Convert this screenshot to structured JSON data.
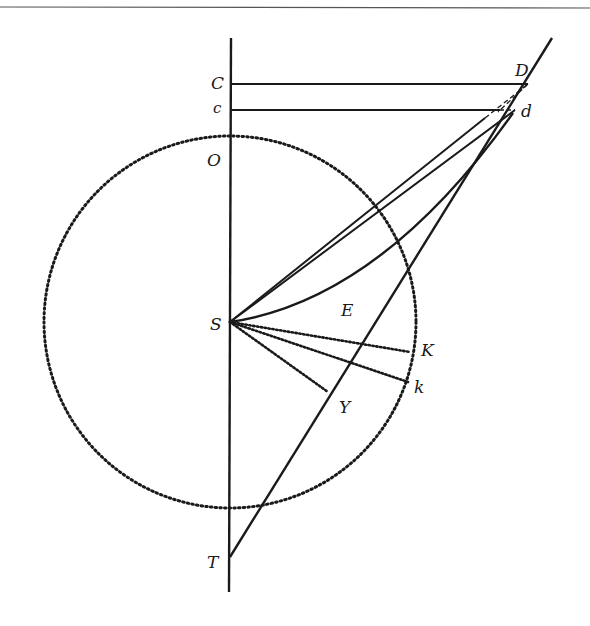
{
  "diagram": {
    "type": "geometric-figure",
    "colors": {
      "ink": "#1a1a1a",
      "background": "#ffffff"
    },
    "labels": {
      "C": "C",
      "c": "c",
      "D": "D",
      "d": "d",
      "O": "O",
      "S": "S",
      "E": "E",
      "K": "K",
      "k": "k",
      "Y": "Y",
      "T": "T"
    },
    "points": {
      "C": [
        230,
        84
      ],
      "c": [
        230,
        110
      ],
      "D": [
        528,
        84
      ],
      "d": [
        515,
        110
      ],
      "O": [
        230,
        136
      ],
      "S": [
        230,
        322
      ],
      "K": [
        410,
        352
      ],
      "k": [
        408,
        382
      ],
      "Y": [
        328,
        392
      ],
      "T": [
        230,
        557
      ]
    },
    "circle": {
      "center": "S",
      "radius": 186,
      "style": "dotted"
    },
    "segments": [
      {
        "from": "C",
        "to": "D",
        "style": "solid"
      },
      {
        "from": "c",
        "to": "d",
        "style": "solid"
      },
      {
        "from": "S",
        "to": "D",
        "style": "solid"
      },
      {
        "from": "S",
        "to": "d",
        "style": "solid"
      },
      {
        "from": "S",
        "to": "d",
        "style": "curve",
        "via": "E"
      },
      {
        "from": "S",
        "to": "K",
        "style": "dotted"
      },
      {
        "from": "S",
        "to": "k",
        "style": "dotted"
      },
      {
        "from": "S",
        "to": "Y",
        "style": "dotted"
      },
      {
        "from": "top",
        "to": "T",
        "style": "solid",
        "through": [
          "D",
          "d"
        ]
      },
      {
        "from": "axis-top",
        "to": "axis-bottom",
        "style": "solid"
      }
    ]
  }
}
